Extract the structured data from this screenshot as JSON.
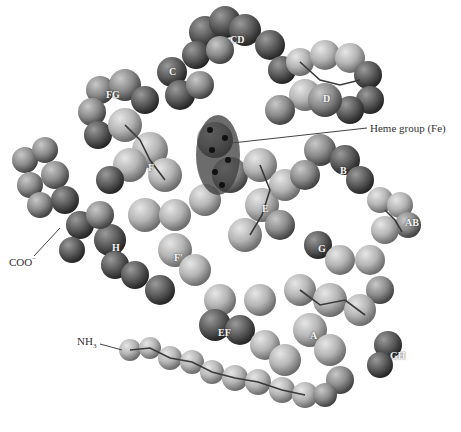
{
  "figure": {
    "style": "space-filling with ball-and-stick backbone, grayscale",
    "colors": {
      "background": "#ffffff",
      "atom_light": "#bdbdbd",
      "atom_mid": "#8a8a8a",
      "atom_dark": "#4a4a4a",
      "heme": "#2a2a2a",
      "label_text": "#f4f4f4",
      "callout_text": "#333333"
    },
    "helix_labels": [
      {
        "id": "CD",
        "text": "CD",
        "x": 230,
        "y": 35
      },
      {
        "id": "C1",
        "text": "C",
        "x": 169,
        "y": 67
      },
      {
        "id": "FG",
        "text": "FG",
        "x": 106,
        "y": 90
      },
      {
        "id": "D",
        "text": "D",
        "x": 323,
        "y": 94
      },
      {
        "id": "F1",
        "text": "F",
        "x": 148,
        "y": 163
      },
      {
        "id": "B",
        "text": "B",
        "x": 340,
        "y": 166
      },
      {
        "id": "E",
        "text": "E",
        "x": 262,
        "y": 204
      },
      {
        "id": "AB",
        "text": "AB",
        "x": 405,
        "y": 218
      },
      {
        "id": "H",
        "text": "H",
        "x": 112,
        "y": 243
      },
      {
        "id": "G",
        "text": "G",
        "x": 318,
        "y": 244
      },
      {
        "id": "F2",
        "text": "F'",
        "x": 174,
        "y": 253
      },
      {
        "id": "EF",
        "text": "EF",
        "x": 218,
        "y": 328
      },
      {
        "id": "A",
        "text": "A",
        "x": 310,
        "y": 331
      },
      {
        "id": "GH",
        "text": "GH",
        "x": 390,
        "y": 351
      }
    ],
    "callouts": {
      "heme": {
        "text": "Heme group (Fe)",
        "x": 370,
        "y": 123
      },
      "coo": {
        "text": "COO",
        "superscript": "−",
        "x": 9,
        "y": 256
      },
      "nh3": {
        "text": "NH",
        "subscript": "3",
        "x": 77,
        "y": 336
      }
    }
  }
}
